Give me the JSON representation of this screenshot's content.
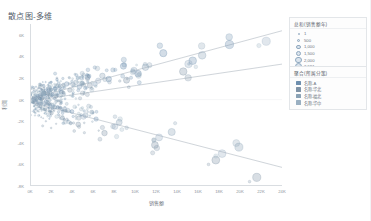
{
  "title": "散点图-多维",
  "axes": {
    "x_title": "销售额",
    "y_title": "利润",
    "x_ticks": [
      "0K",
      "2K",
      "4K",
      "6K",
      "8K",
      "10K",
      "12K",
      "14K",
      "16K",
      "18K",
      "20K",
      "22K",
      "24K"
    ],
    "y_ticks": [
      "6K",
      "4K",
      "2K",
      "0K",
      "-2K",
      "-4K",
      "-6K",
      "-8K"
    ]
  },
  "legend_size": {
    "title": "总和(销售额年)",
    "items": [
      {
        "label": "1",
        "r": 0.9
      },
      {
        "label": "500",
        "r": 1.7
      },
      {
        "label": "1,000",
        "r": 2.3
      },
      {
        "label": "1,500",
        "r": 2.8
      },
      {
        "label": "2,000",
        "r": 3.2
      },
      {
        "label": "2,591",
        "r": 3.6
      }
    ]
  },
  "legend_color": {
    "title": "聚合(所属分策)",
    "items": [
      {
        "label": "名称-A",
        "color": "#6e8fae"
      },
      {
        "label": "名称-华北",
        "color": "#7f93a6"
      },
      {
        "label": "名称-福北",
        "color": "#8aa2b5"
      },
      {
        "label": "名称-华中",
        "color": "#9ab0c2"
      }
    ]
  },
  "chart_data": {
    "type": "scatter",
    "title": "散点图-多维",
    "xlabel": "销售额",
    "ylabel": "利润",
    "xlim": [
      0,
      24000
    ],
    "ylim": [
      -8000,
      7000
    ],
    "grid": false,
    "legend_position": "right",
    "size_field": "总和(销售额年)",
    "size_range": [
      1,
      2591
    ],
    "color_field": "聚合(所属分策)",
    "series": [
      {
        "name": "名称-A",
        "color": "#6e8fae",
        "points": [
          {
            "x": 180,
            "y": 60,
            "size": 40
          },
          {
            "x": 320,
            "y": -120,
            "size": 60
          },
          {
            "x": 450,
            "y": 210,
            "size": 90
          },
          {
            "x": 520,
            "y": -40,
            "size": 55
          },
          {
            "x": 640,
            "y": 340,
            "size": 120
          },
          {
            "x": 700,
            "y": -260,
            "size": 70
          },
          {
            "x": 810,
            "y": 120,
            "size": 110
          },
          {
            "x": 930,
            "y": 480,
            "size": 150
          },
          {
            "x": 1020,
            "y": -380,
            "size": 95
          },
          {
            "x": 1180,
            "y": 260,
            "size": 180
          },
          {
            "x": 1290,
            "y": 620,
            "size": 210
          },
          {
            "x": 1400,
            "y": -150,
            "size": 130
          },
          {
            "x": 1560,
            "y": 380,
            "size": 240
          },
          {
            "x": 1680,
            "y": 840,
            "size": 300
          },
          {
            "x": 1840,
            "y": -520,
            "size": 160
          },
          {
            "x": 2050,
            "y": 460,
            "size": 280
          },
          {
            "x": 2300,
            "y": 1020,
            "size": 380
          },
          {
            "x": 2550,
            "y": -700,
            "size": 200
          },
          {
            "x": 2900,
            "y": 700,
            "size": 420
          },
          {
            "x": 3400,
            "y": 1450,
            "size": 560
          },
          {
            "x": 3900,
            "y": -1100,
            "size": 330
          },
          {
            "x": 4600,
            "y": 1180,
            "size": 640
          },
          {
            "x": 5400,
            "y": 2100,
            "size": 820
          },
          {
            "x": 6200,
            "y": -1800,
            "size": 480
          },
          {
            "x": 7400,
            "y": 1900,
            "size": 1000
          },
          {
            "x": 8800,
            "y": 3100,
            "size": 1300
          },
          {
            "x": 10200,
            "y": 2400,
            "size": 1550
          },
          {
            "x": 12600,
            "y": 4300,
            "size": 1900
          },
          {
            "x": 15400,
            "y": 3600,
            "size": 2200
          },
          {
            "x": 18900,
            "y": 5100,
            "size": 2591
          }
        ]
      },
      {
        "name": "名称-华北",
        "color": "#7f93a6",
        "points": [
          {
            "x": 220,
            "y": -210,
            "size": 45
          },
          {
            "x": 390,
            "y": 90,
            "size": 70
          },
          {
            "x": 560,
            "y": -480,
            "size": 85
          },
          {
            "x": 720,
            "y": 230,
            "size": 100
          },
          {
            "x": 880,
            "y": -620,
            "size": 125
          },
          {
            "x": 1100,
            "y": 150,
            "size": 165
          },
          {
            "x": 1350,
            "y": -900,
            "size": 190
          },
          {
            "x": 1620,
            "y": 520,
            "size": 250
          },
          {
            "x": 1950,
            "y": -1250,
            "size": 290
          },
          {
            "x": 2400,
            "y": 340,
            "size": 360
          },
          {
            "x": 3000,
            "y": -1700,
            "size": 430
          },
          {
            "x": 3700,
            "y": 880,
            "size": 540
          },
          {
            "x": 4500,
            "y": -2300,
            "size": 660
          },
          {
            "x": 5600,
            "y": 1300,
            "size": 790
          },
          {
            "x": 7000,
            "y": -3100,
            "size": 960
          },
          {
            "x": 9100,
            "y": 1800,
            "size": 1250
          },
          {
            "x": 11800,
            "y": -4200,
            "size": 1650
          },
          {
            "x": 14500,
            "y": 2600,
            "size": 2050
          },
          {
            "x": 17600,
            "y": -5600,
            "size": 2350
          },
          {
            "x": 21500,
            "y": -7200,
            "size": 2520
          }
        ]
      },
      {
        "name": "名称-福北",
        "color": "#8aa2b5",
        "points": [
          {
            "x": 150,
            "y": 40,
            "size": 30
          },
          {
            "x": 280,
            "y": -70,
            "size": 50
          },
          {
            "x": 410,
            "y": 180,
            "size": 65
          },
          {
            "x": 600,
            "y": -300,
            "size": 80
          },
          {
            "x": 790,
            "y": 420,
            "size": 105
          },
          {
            "x": 980,
            "y": -160,
            "size": 140
          },
          {
            "x": 1240,
            "y": 690,
            "size": 175
          },
          {
            "x": 1520,
            "y": -420,
            "size": 230
          },
          {
            "x": 1880,
            "y": 900,
            "size": 275
          },
          {
            "x": 2250,
            "y": -680,
            "size": 340
          },
          {
            "x": 2800,
            "y": 1250,
            "size": 410
          },
          {
            "x": 3500,
            "y": -1000,
            "size": 520
          },
          {
            "x": 4300,
            "y": 1600,
            "size": 620
          },
          {
            "x": 5200,
            "y": -1450,
            "size": 760
          },
          {
            "x": 6800,
            "y": 2200,
            "size": 930
          },
          {
            "x": 8400,
            "y": -2100,
            "size": 1150
          },
          {
            "x": 10900,
            "y": 3000,
            "size": 1500
          },
          {
            "x": 13400,
            "y": -3000,
            "size": 1850
          },
          {
            "x": 16300,
            "y": 4100,
            "size": 2180
          },
          {
            "x": 19800,
            "y": -4400,
            "size": 2450
          }
        ]
      },
      {
        "name": "名称-华中",
        "color": "#9ab0c2",
        "points": [
          {
            "x": 200,
            "y": -30,
            "size": 35
          },
          {
            "x": 350,
            "y": 260,
            "size": 55
          },
          {
            "x": 480,
            "y": -200,
            "size": 75
          },
          {
            "x": 660,
            "y": 330,
            "size": 95
          },
          {
            "x": 850,
            "y": -440,
            "size": 115
          },
          {
            "x": 1060,
            "y": 580,
            "size": 155
          },
          {
            "x": 1320,
            "y": -340,
            "size": 200
          },
          {
            "x": 1700,
            "y": 760,
            "size": 260
          },
          {
            "x": 2100,
            "y": -560,
            "size": 310
          },
          {
            "x": 2650,
            "y": 1100,
            "size": 390
          },
          {
            "x": 3200,
            "y": -860,
            "size": 470
          },
          {
            "x": 4000,
            "y": 1400,
            "size": 580
          },
          {
            "x": 5000,
            "y": -1600,
            "size": 700
          },
          {
            "x": 6400,
            "y": 1750,
            "size": 880
          },
          {
            "x": 8000,
            "y": -2500,
            "size": 1080
          },
          {
            "x": 9800,
            "y": 2700,
            "size": 1400
          },
          {
            "x": 12200,
            "y": -3500,
            "size": 1750
          },
          {
            "x": 15000,
            "y": 3300,
            "size": 2100
          },
          {
            "x": 18200,
            "y": -5000,
            "size": 2300
          },
          {
            "x": 22400,
            "y": 5400,
            "size": 2580
          }
        ]
      }
    ],
    "trend_lines": [
      {
        "name": "趋势线-上",
        "x0": 0,
        "y0": 100,
        "x1": 24000,
        "y1": 6400,
        "color": "#9aa5b0"
      },
      {
        "name": "趋势线-中",
        "x0": 0,
        "y0": -120,
        "x1": 24000,
        "y1": 3300,
        "color": "#9aa5b0"
      },
      {
        "name": "趋势线-下",
        "x0": 0,
        "y0": -260,
        "x1": 24000,
        "y1": -6300,
        "color": "#9aa5b0"
      }
    ]
  }
}
